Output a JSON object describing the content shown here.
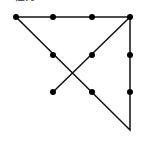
{
  "caption": {
    "text": "任务2",
    "clipped": true
  },
  "diagram": {
    "type": "nine-dot-puzzle-solution",
    "stroke_color": "#111111",
    "dot_color": "#000000",
    "dot_radius": 3,
    "stroke_width": 1.5,
    "dots": [
      {
        "row": 0,
        "col": 0,
        "x": 16,
        "y": 17
      },
      {
        "row": 0,
        "col": 1,
        "x": 53,
        "y": 17
      },
      {
        "row": 0,
        "col": 2,
        "x": 92,
        "y": 17
      },
      {
        "row": 0,
        "col": 3,
        "x": 130,
        "y": 17
      },
      {
        "row": 1,
        "col": 1,
        "x": 53,
        "y": 55
      },
      {
        "row": 1,
        "col": 2,
        "x": 92,
        "y": 55
      },
      {
        "row": 1,
        "col": 3,
        "x": 130,
        "y": 55
      },
      {
        "row": 2,
        "col": 1,
        "x": 53,
        "y": 92
      },
      {
        "row": 2,
        "col": 2,
        "x": 92,
        "y": 92
      },
      {
        "row": 2,
        "col": 3,
        "x": 130,
        "y": 92
      }
    ],
    "path": [
      {
        "x": 53,
        "y": 92
      },
      {
        "x": 130,
        "y": 17
      },
      {
        "x": 16,
        "y": 17
      },
      {
        "x": 130,
        "y": 130
      },
      {
        "x": 130,
        "y": 17
      }
    ]
  }
}
